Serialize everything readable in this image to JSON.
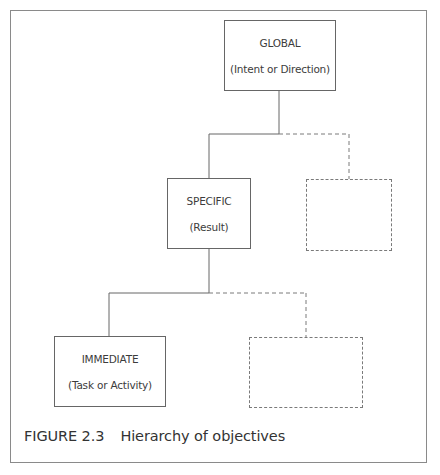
{
  "diagram": {
    "type": "hierarchy",
    "nodes": [
      {
        "id": "global",
        "title": "GLOBAL",
        "subtitle": "(Intent or Direction)",
        "style": "solid",
        "level": 1
      },
      {
        "id": "specific",
        "title": "SPECIFIC",
        "subtitle": "(Result)",
        "style": "solid",
        "level": 2,
        "parent": "global"
      },
      {
        "id": "specific-placeholder",
        "title": "",
        "subtitle": "",
        "style": "dashed",
        "level": 2,
        "parent": "global"
      },
      {
        "id": "immediate",
        "title": "IMMEDIATE",
        "subtitle": "(Task or Activity)",
        "style": "solid",
        "level": 3,
        "parent": "specific"
      },
      {
        "id": "immediate-placeholder",
        "title": "",
        "subtitle": "",
        "style": "dashed",
        "level": 3,
        "parent": "specific"
      }
    ],
    "colors": {
      "line": "#666666",
      "dashed": "#7a7a7a",
      "frame": "#8a8a8a",
      "text": "#3a3a3a"
    }
  },
  "caption": {
    "figure_number": "FIGURE 2.3",
    "text": "Hierarchy of objectives"
  }
}
